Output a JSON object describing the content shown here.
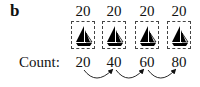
{
  "panel_label": "b",
  "stamps": [
    {
      "value": "20",
      "icon": "sailboat-icon"
    },
    {
      "value": "20",
      "icon": "sailboat-icon"
    },
    {
      "value": "20",
      "icon": "sailboat-icon"
    },
    {
      "value": "20",
      "icon": "sailboat-icon"
    }
  ],
  "count_label": "Count:",
  "counts": [
    "20",
    "40",
    "60",
    "80"
  ]
}
